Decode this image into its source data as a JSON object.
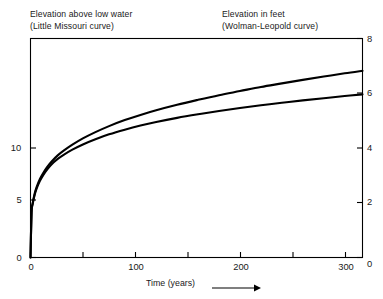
{
  "header": {
    "left_title_line1": "Elevation above low water",
    "left_title_line2": "(Little Missouri curve)",
    "right_title_line1": "Elevation in feet",
    "right_title_line2": "(Wolman-Leopold curve)"
  },
  "axes": {
    "x_title": "Time (years)",
    "x_arrow_icon": "right-arrow-icon",
    "left_ticks": [
      "0",
      "5",
      "10"
    ],
    "right_ticks": [
      "0",
      "2",
      "4",
      "6",
      "8"
    ],
    "x_ticks": [
      "0",
      "100",
      "200",
      "300"
    ]
  },
  "chart_data": {
    "type": "line",
    "title": "",
    "xlabel": "Time (years)",
    "ylabel": "Elevation above low water (Little Missouri curve)",
    "y2label": "Elevation in feet (Wolman-Leopold curve)",
    "xlim": [
      0,
      317
    ],
    "ylim_left": [
      0,
      21
    ],
    "ylim_right": [
      0,
      8
    ],
    "xticks": [
      0,
      100,
      200,
      300
    ],
    "xticks_minor": [
      50,
      150,
      250
    ],
    "yticks_left": [
      0,
      5,
      10
    ],
    "yticks_right": [
      0,
      2,
      4,
      6,
      8
    ],
    "grid": false,
    "legend": "none",
    "line_color": "#000000",
    "series": [
      {
        "name": "Little Missouri curve",
        "axis": "right",
        "x": [
          0,
          1,
          2,
          4,
          6,
          9,
          12,
          16,
          20,
          26,
          32,
          40,
          50,
          62,
          75,
          90,
          105,
          120,
          140,
          160,
          180,
          200,
          220,
          240,
          260,
          280,
          300,
          317
        ],
        "values": [
          0,
          1.62,
          1.93,
          2.29,
          2.53,
          2.8,
          3.0,
          3.22,
          3.4,
          3.6,
          3.76,
          3.94,
          4.13,
          4.32,
          4.5,
          4.67,
          4.82,
          4.95,
          5.1,
          5.23,
          5.35,
          5.46,
          5.56,
          5.65,
          5.74,
          5.82,
          5.9,
          5.96
        ]
      },
      {
        "name": "Wolman-Leopold curve",
        "axis": "right",
        "x": [
          0,
          1,
          2,
          4,
          6,
          9,
          12,
          16,
          20,
          26,
          32,
          40,
          50,
          62,
          75,
          90,
          105,
          120,
          140,
          160,
          180,
          200,
          220,
          240,
          260,
          280,
          300,
          317
        ],
        "values": [
          0,
          1.65,
          1.97,
          2.34,
          2.59,
          2.87,
          3.08,
          3.31,
          3.5,
          3.73,
          3.91,
          4.12,
          4.35,
          4.58,
          4.8,
          5.02,
          5.21,
          5.38,
          5.58,
          5.76,
          5.93,
          6.08,
          6.23,
          6.36,
          6.49,
          6.61,
          6.73,
          6.82
        ]
      }
    ]
  }
}
